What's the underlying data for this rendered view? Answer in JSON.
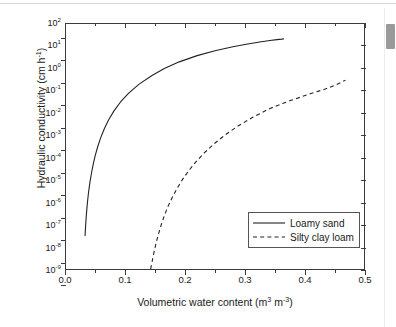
{
  "window": {
    "scrollbar": {
      "name": "vertical-scrollbar"
    }
  },
  "chart_data": {
    "type": "line",
    "title": "",
    "xlabel": "Volumetric water content (m³ m⁻³)",
    "ylabel": "Hydraulic conductivity (cm h⁻¹)",
    "xlabel_parts": {
      "text": "Volumetric water content (m",
      "sup1": "3",
      "mid": " m",
      "sup2": "-3",
      "tail": ")"
    },
    "ylabel_parts": {
      "text": "Hydraulic conductivity (cm h",
      "sup1": "-1",
      "tail": ")"
    },
    "xlim": [
      0.0,
      0.5
    ],
    "ylim_log10": [
      -9,
      2
    ],
    "yscale": "log",
    "grid": false,
    "legend_position": "lower-right-inside",
    "xticks": [
      0.0,
      0.1,
      0.2,
      0.3,
      0.4,
      0.5
    ],
    "xtick_labels": [
      "0.0",
      "0.1",
      "0.2",
      "0.3",
      "0.4",
      "0.5"
    ],
    "xminor_ticks": [
      0.05,
      0.15,
      0.25,
      0.35,
      0.45
    ],
    "yticks_exponent": [
      2,
      1,
      0,
      -1,
      -2,
      -3,
      -4,
      -5,
      -6,
      -7,
      -8,
      -9
    ],
    "ytick_labels": [
      "10",
      "10",
      "10",
      "10",
      "10",
      "10",
      "10",
      "10",
      "10",
      "10",
      "10",
      "10"
    ],
    "ytick_exponent_labels": [
      "2",
      "1",
      "0",
      "-1",
      "-2",
      "-3",
      "-4",
      "-5",
      "-6",
      "-7",
      "-8",
      "-9"
    ],
    "series": [
      {
        "name": "Loamy sand",
        "style": "solid",
        "color": "#222222",
        "points": [
          [
            0.032,
            -7.5
          ],
          [
            0.0328,
            -7.1
          ],
          [
            0.0338,
            -6.7
          ],
          [
            0.035,
            -6.3
          ],
          [
            0.0364,
            -5.9
          ],
          [
            0.0381,
            -5.5
          ],
          [
            0.0402,
            -5.1
          ],
          [
            0.0427,
            -4.7
          ],
          [
            0.0456,
            -4.3
          ],
          [
            0.0491,
            -3.9
          ],
          [
            0.0533,
            -3.5
          ],
          [
            0.0583,
            -3.1
          ],
          [
            0.0643,
            -2.7
          ],
          [
            0.0716,
            -2.3
          ],
          [
            0.0805,
            -1.9
          ],
          [
            0.0915,
            -1.5
          ],
          [
            0.1052,
            -1.1
          ],
          [
            0.1227,
            -0.7
          ],
          [
            0.145,
            -0.3
          ],
          [
            0.165,
            0.0
          ],
          [
            0.19,
            0.3
          ],
          [
            0.22,
            0.58
          ],
          [
            0.25,
            0.8
          ],
          [
            0.28,
            0.98
          ],
          [
            0.305,
            1.1
          ],
          [
            0.325,
            1.19
          ],
          [
            0.342,
            1.26
          ],
          [
            0.354,
            1.3
          ],
          [
            0.362,
            1.32
          ],
          [
            0.365,
            1.33
          ]
        ]
      },
      {
        "name": "Silty clay loam",
        "style": "dashed",
        "color": "#222222",
        "points": [
          [
            0.142,
            -9.0
          ],
          [
            0.145,
            -8.6
          ],
          [
            0.148,
            -8.2
          ],
          [
            0.1515,
            -7.8
          ],
          [
            0.1555,
            -7.4
          ],
          [
            0.16,
            -7.0
          ],
          [
            0.165,
            -6.6
          ],
          [
            0.171,
            -6.2
          ],
          [
            0.178,
            -5.8
          ],
          [
            0.186,
            -5.4
          ],
          [
            0.195,
            -5.0
          ],
          [
            0.2055,
            -4.6
          ],
          [
            0.2175,
            -4.2
          ],
          [
            0.2315,
            -3.8
          ],
          [
            0.2475,
            -3.4
          ],
          [
            0.266,
            -3.0
          ],
          [
            0.2875,
            -2.6
          ],
          [
            0.3125,
            -2.2
          ],
          [
            0.3415,
            -1.8
          ],
          [
            0.375,
            -1.45
          ],
          [
            0.408,
            -1.15
          ],
          [
            0.435,
            -0.92
          ],
          [
            0.452,
            -0.74
          ],
          [
            0.463,
            -0.6
          ],
          [
            0.469,
            -0.52
          ]
        ]
      }
    ],
    "legend": [
      {
        "label": "Loamy sand",
        "style": "solid"
      },
      {
        "label": "Silty clay loam",
        "style": "dashed"
      }
    ]
  }
}
